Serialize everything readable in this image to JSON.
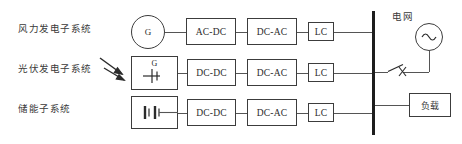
{
  "diagram": {
    "title_hidden": "",
    "subsystems": [
      {
        "label": "风力发电子系统",
        "source_symbol": "generator-circle",
        "source_text": "G",
        "stages": [
          "AC-DC",
          "DC-AC",
          "LC"
        ]
      },
      {
        "label": "光伏发电子系统",
        "source_symbol": "pv-dc-source",
        "source_text": "G",
        "stages": [
          "DC-DC",
          "DC-AC",
          "LC"
        ]
      },
      {
        "label": "储能子系统",
        "source_symbol": "battery-cells",
        "source_text": "",
        "stages": [
          "DC-DC",
          "DC-AC",
          "LC"
        ]
      }
    ],
    "bus": {
      "name": "ac-bus-bar"
    },
    "grid": {
      "label": "电网",
      "symbol": "ac-source-sine"
    },
    "switch": {
      "name": "open-switch",
      "marker": "x"
    },
    "load": {
      "label": "负载"
    },
    "colors": {
      "line": "#555555",
      "box_border": "#3c3c3c",
      "bus": "#1d1d1d",
      "text": "#2b2b2b",
      "label_text": "#3a3a3a",
      "background": "#ffffff"
    }
  }
}
